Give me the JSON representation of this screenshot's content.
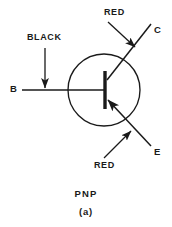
{
  "figure": {
    "type": "transistor-schematic",
    "device": "PNP bipolar junction transistor",
    "caption_name": "PNP",
    "caption_index": "(a)",
    "colors": {
      "line": "#1a1a1a",
      "background": "#ffffff"
    }
  },
  "terminals": {
    "base": "B",
    "collector": "C",
    "emitter": "E"
  },
  "lead_color_annotations": {
    "base_wire": "BLACK",
    "collector_wire": "RED",
    "emitter_wire": "RED"
  },
  "geometry": {
    "circle_center_x": 104,
    "circle_center_y": 90,
    "circle_radius": 36,
    "base_bar_x": 105,
    "base_bar_top_y": 72,
    "base_bar_bottom_y": 108
  }
}
